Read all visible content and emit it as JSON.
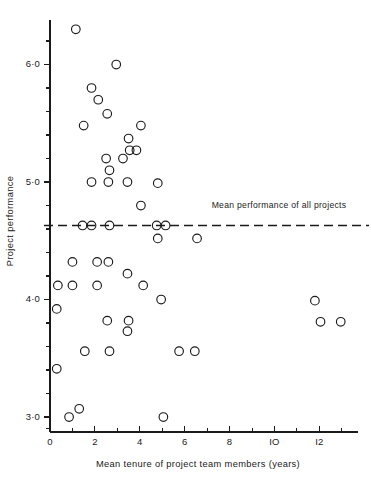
{
  "chart_data": {
    "type": "scatter",
    "title": "",
    "xlabel": "Mean tenure of project team members (years)",
    "ylabel": "Project performance",
    "xlim": [
      0,
      13.6
    ],
    "ylim": [
      2.85,
      6.45
    ],
    "grid": false,
    "legend": null,
    "x_ticks_major": [
      0,
      2,
      4,
      6,
      8,
      10,
      12
    ],
    "x_tick_labels": [
      "0",
      "2",
      "4",
      "6",
      "8",
      "IO",
      "I2"
    ],
    "x_ticks_minor": [
      1,
      3,
      5,
      7,
      9,
      11,
      13
    ],
    "y_ticks_major": [
      3.0,
      4.0,
      5.0,
      6.0
    ],
    "y_tick_labels": [
      "3·0",
      "4·0",
      "5·0",
      "6·0"
    ],
    "y_ticks_minor": [
      3.2,
      3.4,
      3.6,
      3.8,
      4.2,
      4.4,
      4.6,
      4.8,
      5.2,
      5.4,
      5.6,
      5.8,
      6.2
    ],
    "marker": "open-circle",
    "marker_size": 4.3,
    "annotations": [
      {
        "name": "mean-performance-line",
        "type": "hline",
        "y": 4.63,
        "label": "Mean performance of all projects",
        "style": "dashed",
        "label_x": 7.2,
        "label_y": 4.78
      }
    ],
    "points": [
      {
        "x": 1.15,
        "y": 6.3
      },
      {
        "x": 2.95,
        "y": 6.0
      },
      {
        "x": 1.85,
        "y": 5.8
      },
      {
        "x": 2.15,
        "y": 5.7
      },
      {
        "x": 2.55,
        "y": 5.58
      },
      {
        "x": 1.5,
        "y": 5.48
      },
      {
        "x": 4.05,
        "y": 5.48
      },
      {
        "x": 3.5,
        "y": 5.37
      },
      {
        "x": 3.55,
        "y": 5.27
      },
      {
        "x": 3.85,
        "y": 5.27
      },
      {
        "x": 2.5,
        "y": 5.2
      },
      {
        "x": 3.25,
        "y": 5.2
      },
      {
        "x": 2.65,
        "y": 5.1
      },
      {
        "x": 1.85,
        "y": 5.0
      },
      {
        "x": 2.6,
        "y": 5.0
      },
      {
        "x": 3.45,
        "y": 5.0
      },
      {
        "x": 4.8,
        "y": 4.99
      },
      {
        "x": 4.05,
        "y": 4.8
      },
      {
        "x": 1.45,
        "y": 4.63
      },
      {
        "x": 1.85,
        "y": 4.63
      },
      {
        "x": 2.65,
        "y": 4.63
      },
      {
        "x": 4.75,
        "y": 4.63
      },
      {
        "x": 5.15,
        "y": 4.63
      },
      {
        "x": 4.8,
        "y": 4.52
      },
      {
        "x": 6.55,
        "y": 4.52
      },
      {
        "x": 1.0,
        "y": 4.32
      },
      {
        "x": 2.1,
        "y": 4.32
      },
      {
        "x": 2.6,
        "y": 4.32
      },
      {
        "x": 3.45,
        "y": 4.22
      },
      {
        "x": 0.35,
        "y": 4.12
      },
      {
        "x": 1.0,
        "y": 4.12
      },
      {
        "x": 2.1,
        "y": 4.12
      },
      {
        "x": 4.15,
        "y": 4.12
      },
      {
        "x": 4.95,
        "y": 4.0
      },
      {
        "x": 11.8,
        "y": 3.99
      },
      {
        "x": 0.3,
        "y": 3.92
      },
      {
        "x": 2.55,
        "y": 3.82
      },
      {
        "x": 3.5,
        "y": 3.82
      },
      {
        "x": 12.05,
        "y": 3.81
      },
      {
        "x": 12.95,
        "y": 3.81
      },
      {
        "x": 3.45,
        "y": 3.73
      },
      {
        "x": 1.55,
        "y": 3.56
      },
      {
        "x": 2.65,
        "y": 3.56
      },
      {
        "x": 5.75,
        "y": 3.56
      },
      {
        "x": 6.45,
        "y": 3.56
      },
      {
        "x": 0.3,
        "y": 3.41
      },
      {
        "x": 1.3,
        "y": 3.07
      },
      {
        "x": 0.85,
        "y": 3.0
      },
      {
        "x": 5.05,
        "y": 3.0
      }
    ]
  },
  "colors": {
    "ink": "#1a1a1a",
    "background": "#ffffff"
  }
}
